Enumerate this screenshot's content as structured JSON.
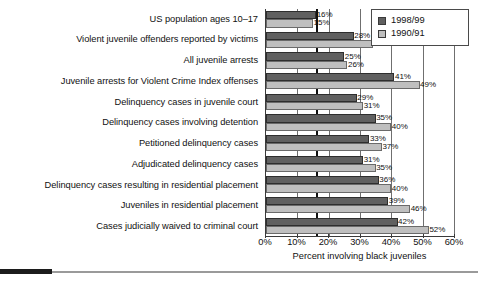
{
  "chart_data": {
    "type": "bar",
    "orientation": "horizontal",
    "title": "",
    "xlabel": "Percent involving black juveniles",
    "ylabel": "",
    "xlim": [
      0,
      60
    ],
    "xtick_labels": [
      "0%",
      "10%",
      "20%",
      "30%",
      "40%",
      "50%",
      "60%"
    ],
    "xtick_values": [
      0,
      10,
      20,
      30,
      40,
      50,
      60
    ],
    "grid": true,
    "grid_axis": "x",
    "legend_position": "top-right",
    "reference_line": 16,
    "categories": [
      "US population ages 10–17",
      "Violent juvenile offenders reported by victims",
      "All juvenile arrests",
      "Juvenile arrests for Violent Crime Index offenses",
      "Delinquency cases in juvenile court",
      "Delinquency cases involving detention",
      "Petitioned delinquency cases",
      "Adjudicated delinquency cases",
      "Delinquency cases resulting in residential placement",
      "Juveniles in residential placement",
      "Cases judicially waived to criminal court"
    ],
    "series": [
      {
        "name": "1998/99",
        "color": "#606060",
        "values": [
          16,
          28,
          25,
          41,
          29,
          35,
          33,
          31,
          36,
          39,
          42
        ],
        "labels": [
          "16%",
          "28%",
          "25%",
          "41%",
          "29%",
          "35%",
          "33%",
          "31%",
          "36%",
          "39%",
          "42%"
        ]
      },
      {
        "name": "1990/91",
        "color": "#bfbfbf",
        "values": [
          15,
          34,
          26,
          49,
          31,
          40,
          37,
          35,
          40,
          46,
          52
        ],
        "labels": [
          "15%",
          "34%",
          "26%",
          "49%",
          "31%",
          "40%",
          "37%",
          "35%",
          "40%",
          "46%",
          "52%"
        ]
      }
    ]
  }
}
